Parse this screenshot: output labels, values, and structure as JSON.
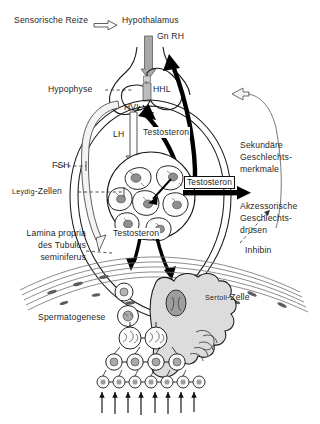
{
  "figure": {
    "language": "de",
    "type": "biological-schematic-diagram",
    "background_color": "#ffffff",
    "ink_color": "#1a1a1a"
  },
  "labels": {
    "sensory_stimuli": "Sensorische Reize",
    "hypothalamus": "Hypothalamus",
    "gnrh": "Gn RH",
    "hypophysis": "Hypophyse",
    "hhl": "HHL",
    "hvl": "HVL",
    "lh": "LH",
    "fsh": "FSH",
    "testosterone_pituitary": "Testosteron",
    "testosterone_systemic": "Testosteron",
    "testosterone_tubule": "Testosteron",
    "leydig_cells_smallcaps": "Leydig",
    "leydig_cells_rest": "-Zellen",
    "secondary_sex_line1": "Sekundäre",
    "secondary_sex_line2": "Geschlechts-",
    "secondary_sex_line3": "merkmale",
    "accessory_glands_line1": "Akzessorische",
    "accessory_glands_line2": "Geschlechts-",
    "accessory_glands_line3": "drüsen",
    "inhibin": "Inhibin",
    "lamina_line1": "Lamina propria",
    "lamina_line2": "des Tubulus",
    "lamina_line3": "seminiferus",
    "sertoli_smallcaps": "Sertoli",
    "sertoli_rest": "-Zelle",
    "spermatogenesis": "Spermatogenese"
  },
  "colors": {
    "outline": "#1a1a1a",
    "fill_light": "#e6e6e6",
    "fill_mid": "#c9c9c9",
    "fill_dark": "#9a9a9a",
    "arrow_black": "#000000",
    "arrow_hollow_stroke": "#555555"
  }
}
